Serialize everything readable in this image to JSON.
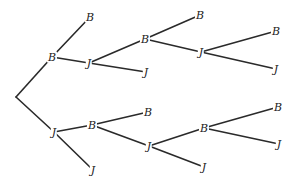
{
  "diagram": {
    "type": "tree",
    "colors": {
      "line": "#2a2a2a",
      "text": "#222222",
      "background": "#ffffff"
    },
    "nodes": [
      {
        "id": "root",
        "label": "",
        "x": 16,
        "y": 97
      },
      {
        "id": "n1",
        "label": "B",
        "x": 52,
        "y": 57
      },
      {
        "id": "n2",
        "label": "J",
        "x": 54,
        "y": 132
      },
      {
        "id": "n3",
        "label": "B",
        "x": 90,
        "y": 17
      },
      {
        "id": "n4",
        "label": "J",
        "x": 89,
        "y": 63
      },
      {
        "id": "n5",
        "label": "B",
        "x": 92,
        "y": 125
      },
      {
        "id": "n6",
        "label": "J",
        "x": 93,
        "y": 170
      },
      {
        "id": "n7",
        "label": "B",
        "x": 145,
        "y": 39
      },
      {
        "id": "n8",
        "label": "J",
        "x": 146,
        "y": 72
      },
      {
        "id": "n9",
        "label": "B",
        "x": 148,
        "y": 112
      },
      {
        "id": "n10",
        "label": "J",
        "x": 149,
        "y": 146
      },
      {
        "id": "n11",
        "label": "B",
        "x": 200,
        "y": 15
      },
      {
        "id": "n12",
        "label": "J",
        "x": 201,
        "y": 52
      },
      {
        "id": "n13",
        "label": "B",
        "x": 204,
        "y": 128
      },
      {
        "id": "n14",
        "label": "J",
        "x": 204,
        "y": 167
      },
      {
        "id": "n15",
        "label": "B",
        "x": 276,
        "y": 31
      },
      {
        "id": "n16",
        "label": "J",
        "x": 276,
        "y": 69
      },
      {
        "id": "n17",
        "label": "B",
        "x": 278,
        "y": 107
      },
      {
        "id": "n18",
        "label": "J",
        "x": 279,
        "y": 144
      }
    ],
    "edges": [
      [
        "root",
        "n1"
      ],
      [
        "root",
        "n2"
      ],
      [
        "n1",
        "n3"
      ],
      [
        "n1",
        "n4"
      ],
      [
        "n2",
        "n5"
      ],
      [
        "n2",
        "n6"
      ],
      [
        "n4",
        "n7"
      ],
      [
        "n4",
        "n8"
      ],
      [
        "n5",
        "n9"
      ],
      [
        "n5",
        "n10"
      ],
      [
        "n7",
        "n11"
      ],
      [
        "n7",
        "n12"
      ],
      [
        "n10",
        "n13"
      ],
      [
        "n10",
        "n14"
      ],
      [
        "n12",
        "n15"
      ],
      [
        "n12",
        "n16"
      ],
      [
        "n13",
        "n17"
      ],
      [
        "n13",
        "n18"
      ]
    ]
  }
}
